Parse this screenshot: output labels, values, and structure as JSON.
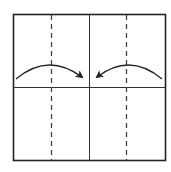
{
  "diagram": {
    "type": "origami-fold-step",
    "paper": {
      "x": 13,
      "y": 14,
      "width": 153,
      "height": 147,
      "stroke": "#222222"
    },
    "creases": {
      "vertical_center": {
        "x": 89,
        "style": "solid"
      },
      "horizontal_center": {
        "y": 87,
        "style": "solid"
      }
    },
    "fold_lines": [
      {
        "name": "valley-fold-left",
        "x": 51,
        "style": "dashed"
      },
      {
        "name": "valley-fold-right",
        "x": 126,
        "style": "dashed"
      }
    ],
    "arrows": [
      {
        "name": "fold-arrow-left",
        "direction": "right",
        "meaning": "fold left edge to center"
      },
      {
        "name": "fold-arrow-right",
        "direction": "left",
        "meaning": "fold right edge to center"
      }
    ],
    "colors": {
      "line": "#222222",
      "dash": "#444444",
      "background": "#ffffff"
    }
  }
}
